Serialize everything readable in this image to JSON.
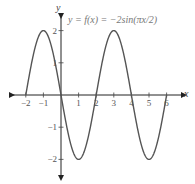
{
  "chart_data": {
    "type": "line",
    "title": "y = f(x) = −2sin(πx/2)",
    "xlabel": "x",
    "ylabel": "y",
    "x_ticks": [
      -2,
      -1,
      1,
      2,
      3,
      4,
      5,
      6
    ],
    "y_ticks": [
      -2,
      -1,
      1,
      2
    ],
    "xlim": [
      -2.5,
      6.5
    ],
    "ylim": [
      -2.5,
      2.5
    ],
    "grid": false,
    "series": [
      {
        "name": "f(x) = -2sin(pi x / 2)",
        "x": [
          -2,
          -1,
          0,
          1,
          2,
          3,
          4,
          5,
          6
        ],
        "values": [
          0,
          2,
          0,
          -2,
          0,
          2,
          0,
          -2,
          0
        ]
      }
    ]
  },
  "labels": {
    "equation": "y = f(x) = −2sin(πx/2)",
    "x_axis": "x",
    "y_axis": "y"
  }
}
